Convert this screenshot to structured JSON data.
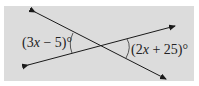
{
  "figure": {
    "type": "intersecting-lines",
    "background": "#dcdcdc",
    "line_color": "#1a1a1a",
    "lines": [
      {
        "name": "line-a",
        "from": [
          35,
          12
        ],
        "to": [
          166,
          79
        ]
      },
      {
        "name": "line-b",
        "from": [
          28,
          65
        ],
        "to": [
          175,
          26
        ]
      }
    ],
    "angles": {
      "left": {
        "label_prefix": "(3",
        "var": "x",
        "label_suffix": " − 5)°"
      },
      "right": {
        "label_prefix": "(2",
        "var": "x",
        "label_suffix": " + 25)°"
      }
    }
  }
}
